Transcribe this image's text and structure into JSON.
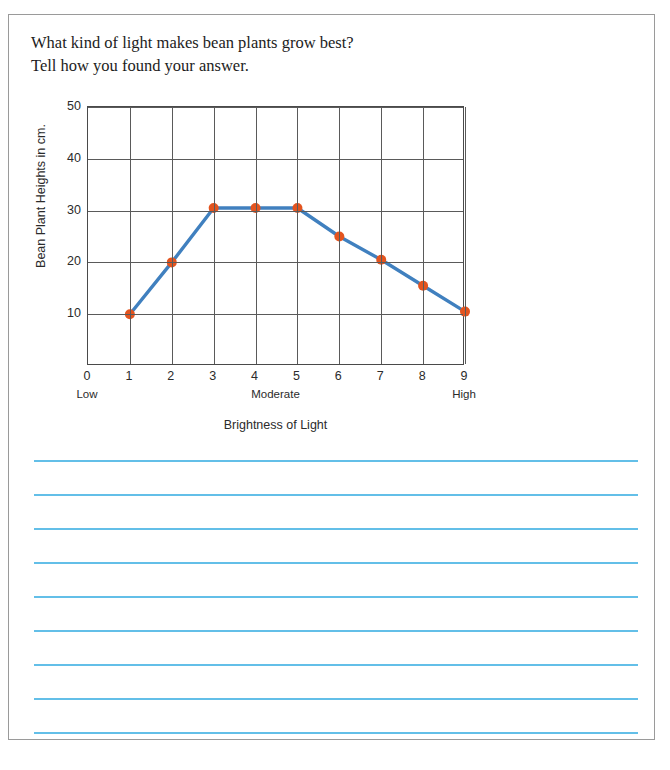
{
  "prompt": {
    "line1": "What kind of light makes bean plants grow best?",
    "line2": "Tell how you found your answer."
  },
  "chart_data": {
    "type": "line",
    "title": "",
    "xlabel": "Brightness of Light",
    "ylabel": "Bean Plant Heights in cm.",
    "x": [
      1,
      2,
      3,
      4,
      5,
      6,
      7,
      8,
      9
    ],
    "values": [
      10,
      20,
      30.5,
      30.5,
      30.5,
      25,
      20.5,
      15.5,
      10.5
    ],
    "xlim": [
      0,
      9
    ],
    "ylim": [
      0,
      50
    ],
    "xticks": [
      "0",
      "1",
      "2",
      "3",
      "4",
      "5",
      "6",
      "7",
      "8",
      "9"
    ],
    "yticks": [
      "10",
      "20",
      "30",
      "40",
      "50"
    ],
    "ytick_values": [
      10,
      20,
      30,
      40,
      50
    ],
    "zone_labels": [
      {
        "text": "Low",
        "x": 0
      },
      {
        "text": "Moderate",
        "x": 4.5
      },
      {
        "text": "High",
        "x": 9
      }
    ],
    "grid": true,
    "legend": "none",
    "marker_color": "#e3541f",
    "line_color": "#4080bf",
    "grid_color": "#5a5a5a",
    "axis_color": "#4a4a4a"
  },
  "answer_area": {
    "line_count": 9,
    "line_color": "#63bfe8",
    "lines": [
      "",
      "",
      "",
      "",
      "",
      "",
      "",
      "",
      ""
    ]
  }
}
